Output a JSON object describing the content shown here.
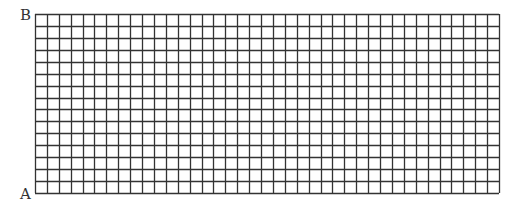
{
  "diagram": {
    "type": "grid",
    "labels": {
      "top_left": "B",
      "bottom_left": "A"
    },
    "grid": {
      "columns": 39,
      "rows": 15,
      "left": 35,
      "top": 14,
      "right": 499,
      "bottom": 193,
      "line_color": "#333333"
    }
  }
}
